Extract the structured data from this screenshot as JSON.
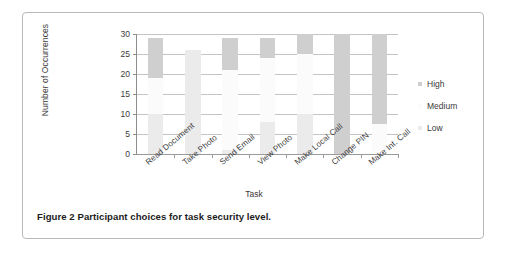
{
  "figure": {
    "caption": "Figure 2  Participant choices for task security level."
  },
  "chart_data": {
    "type": "bar",
    "subtype": "stacked-column",
    "title": "",
    "xlabel": "Task",
    "ylabel": "Number of Occurrences",
    "ylim": [
      0,
      30
    ],
    "yticks": [
      0,
      5,
      10,
      15,
      20,
      25,
      30
    ],
    "grid": true,
    "legend_position": "right",
    "categories": [
      "Read Document",
      "Take Photo",
      "Send Email",
      "View Photo",
      "Make Local Call",
      "Change PIN",
      "Make Int. Call"
    ],
    "series": [
      {
        "name": "Low",
        "color": "#ebebeb",
        "values": [
          10,
          26,
          1,
          8,
          10,
          0,
          0
        ]
      },
      {
        "name": "Medium",
        "color": "#fbfbfb",
        "values": [
          9,
          0,
          20,
          16,
          15,
          0,
          7.5
        ]
      },
      {
        "name": "High",
        "color": "#cfcfcf",
        "values": [
          10,
          0,
          8,
          5,
          5,
          30,
          22.5
        ]
      }
    ],
    "totals": [
      29,
      26,
      29,
      29,
      30,
      30,
      30
    ]
  },
  "legend": {
    "items": [
      {
        "label": "High",
        "color": "#cfcfcf"
      },
      {
        "label": "Medium",
        "color": "#fbfbfb"
      },
      {
        "label": "Low",
        "color": "#ebebeb"
      }
    ]
  },
  "axis": {
    "y_title": "Number of Occurrences",
    "x_title": "Task",
    "y_tick_labels": [
      "30",
      "25",
      "20",
      "15",
      "10",
      "5",
      "0"
    ]
  }
}
